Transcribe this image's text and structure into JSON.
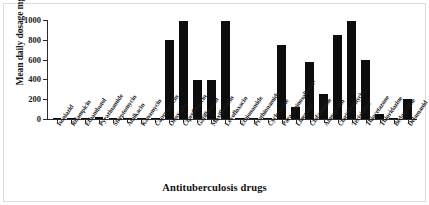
{
  "chart_data": {
    "type": "bar",
    "title": "",
    "xlabel": "Antituberculosis drugs",
    "ylabel": "Mean daily dosage mg/kg",
    "ylim": [
      0,
      1000
    ],
    "yticks": [
      0,
      200,
      400,
      600,
      800,
      1000
    ],
    "ytick_labels": [
      "0",
      "200",
      "400",
      "600",
      "800",
      "1000"
    ],
    "grid": false,
    "legend": null,
    "bar_color": "#0d0d0d",
    "categories": [
      "Isoniazid",
      "Rifampicin",
      "Ethambutol",
      "Pyrazinamide",
      "Streptomycin",
      "Amikacin",
      "Kanamycin",
      "Capreomycin",
      "Ofloxacin",
      "Ciprofloxacin",
      "Gatifloxacin",
      "Moxifloxacin",
      "Levofloxacin",
      "Ethionamide",
      "Prothionamide",
      "Cycloserine",
      "Para-aminosalicylic-",
      "Linezolid",
      "Clofazimine",
      "Amoxicillin",
      "Clarithromycin",
      "Terizidone",
      "Thiacetazone",
      "Thioridazine",
      "Bedaquiline",
      "Delamanid"
    ],
    "values": [
      5,
      10,
      15,
      25,
      15,
      15,
      15,
      15,
      795,
      990,
      390,
      390,
      990,
      10,
      10,
      10,
      750,
      120,
      580,
      250,
      850,
      990,
      600,
      50,
      15,
      200
    ]
  }
}
